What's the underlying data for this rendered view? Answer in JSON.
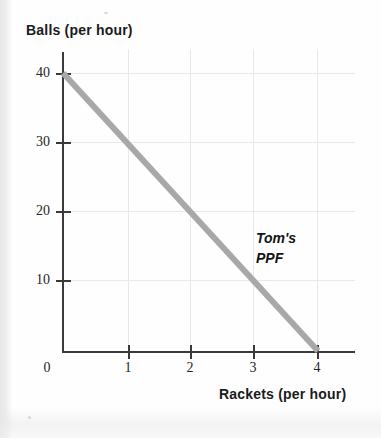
{
  "chart_data": {
    "type": "line",
    "title": "",
    "xlabel": "Rackets (per hour)",
    "ylabel": "Balls (per hour)",
    "xlim": [
      0,
      4.65
    ],
    "ylim": [
      0,
      43
    ],
    "grid": true,
    "legend": "none",
    "x_ticks": [
      {
        "value": 0,
        "label": "0"
      },
      {
        "value": 1,
        "label": "1"
      },
      {
        "value": 2,
        "label": "2"
      },
      {
        "value": 3,
        "label": "3"
      },
      {
        "value": 4,
        "label": "4"
      }
    ],
    "y_ticks": [
      {
        "value": 40,
        "label": "40"
      },
      {
        "value": 30,
        "label": "30"
      },
      {
        "value": 20,
        "label": "20"
      },
      {
        "value": 10,
        "label": "10"
      }
    ],
    "series": [
      {
        "name": "Tom's PPF",
        "color": "#a8a8a8",
        "x": [
          0,
          1,
          2,
          3,
          4
        ],
        "y": [
          40,
          30,
          20,
          10,
          0
        ]
      }
    ],
    "annotations": [
      {
        "name": "curve-label",
        "line1": "Tom's",
        "line2": "PPF",
        "x": 3.1,
        "y": 16
      }
    ]
  }
}
